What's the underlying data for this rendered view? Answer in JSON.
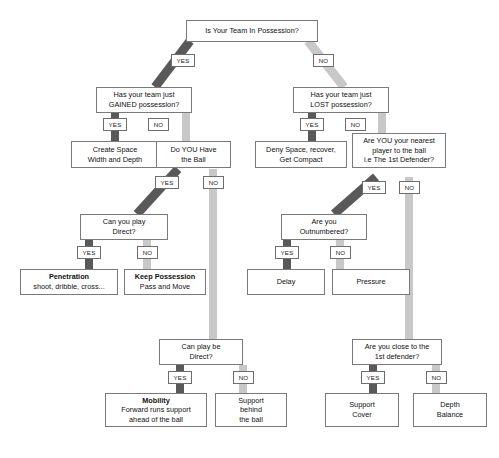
{
  "diagram": {
    "colors": {
      "yes_connector": "#595959",
      "no_connector": "#c8c8c8",
      "node_border": "#7a7a7a",
      "background": "#ffffff",
      "text": "#111111"
    },
    "branch_labels": {
      "yes": "YES",
      "no": "NO"
    },
    "nodes": [
      {
        "id": "root",
        "lines": [
          "Is Your Team In Possession?"
        ],
        "bold": []
      },
      {
        "id": "gained",
        "lines": [
          "Has your team just",
          "GAINED possession?"
        ],
        "bold": []
      },
      {
        "id": "lost",
        "lines": [
          "Has your team just",
          "LOST possession?"
        ],
        "bold": []
      },
      {
        "id": "create",
        "lines": [
          "Create Space",
          "Width and Depth"
        ],
        "bold": []
      },
      {
        "id": "haveball",
        "lines": [
          "Do YOU Have",
          "the Ball"
        ],
        "bold": []
      },
      {
        "id": "deny",
        "lines": [
          "Deny Space, recover,",
          "Get Compact"
        ],
        "bold": []
      },
      {
        "id": "nearest",
        "lines": [
          "Are YOU your nearest",
          "player to the ball",
          "i.e The 1st Defender?"
        ],
        "bold": []
      },
      {
        "id": "direct1",
        "lines": [
          "Can you play",
          "Direct?"
        ],
        "bold": []
      },
      {
        "id": "outnumber",
        "lines": [
          "Are you",
          "Outnumbered?"
        ],
        "bold": []
      },
      {
        "id": "penetration",
        "lines": [
          "Penetration",
          "shoot, dribble, cross..."
        ],
        "bold": [
          0
        ]
      },
      {
        "id": "keep",
        "lines": [
          "Keep Possession",
          "Pass and Move"
        ],
        "bold": [
          0
        ]
      },
      {
        "id": "delay",
        "lines": [
          "Delay"
        ],
        "bold": []
      },
      {
        "id": "pressure",
        "lines": [
          "Pressure"
        ],
        "bold": []
      },
      {
        "id": "direct2",
        "lines": [
          "Can play be",
          "Direct?"
        ],
        "bold": []
      },
      {
        "id": "close1st",
        "lines": [
          "Are you close to the",
          "1st defender?"
        ],
        "bold": []
      },
      {
        "id": "mobility",
        "lines": [
          "Mobility",
          "Forward runs support",
          "ahead of the ball"
        ],
        "bold": [
          0
        ]
      },
      {
        "id": "supportbeh",
        "lines": [
          "Support",
          "behind",
          "the ball"
        ],
        "bold": []
      },
      {
        "id": "supportcov",
        "lines": [
          "Support",
          "Cover"
        ],
        "bold": []
      },
      {
        "id": "depthbal",
        "lines": [
          "Depth",
          "Balance"
        ],
        "bold": []
      }
    ],
    "edges": [
      {
        "from": "root",
        "to": "gained",
        "branch": "yes"
      },
      {
        "from": "root",
        "to": "lost",
        "branch": "no"
      },
      {
        "from": "gained",
        "to": "create",
        "branch": "yes"
      },
      {
        "from": "gained",
        "to": "haveball",
        "branch": "no"
      },
      {
        "from": "lost",
        "to": "deny",
        "branch": "yes"
      },
      {
        "from": "lost",
        "to": "nearest",
        "branch": "no"
      },
      {
        "from": "haveball",
        "to": "direct1",
        "branch": "yes"
      },
      {
        "from": "haveball",
        "to": "direct2",
        "branch": "no"
      },
      {
        "from": "nearest",
        "to": "outnumber",
        "branch": "yes"
      },
      {
        "from": "nearest",
        "to": "close1st",
        "branch": "no"
      },
      {
        "from": "direct1",
        "to": "penetration",
        "branch": "yes"
      },
      {
        "from": "direct1",
        "to": "keep",
        "branch": "no"
      },
      {
        "from": "outnumber",
        "to": "delay",
        "branch": "yes"
      },
      {
        "from": "outnumber",
        "to": "pressure",
        "branch": "no"
      },
      {
        "from": "direct2",
        "to": "mobility",
        "branch": "yes"
      },
      {
        "from": "direct2",
        "to": "supportbeh",
        "branch": "no"
      },
      {
        "from": "close1st",
        "to": "supportcov",
        "branch": "yes"
      },
      {
        "from": "close1st",
        "to": "depthbal",
        "branch": "no"
      }
    ]
  }
}
